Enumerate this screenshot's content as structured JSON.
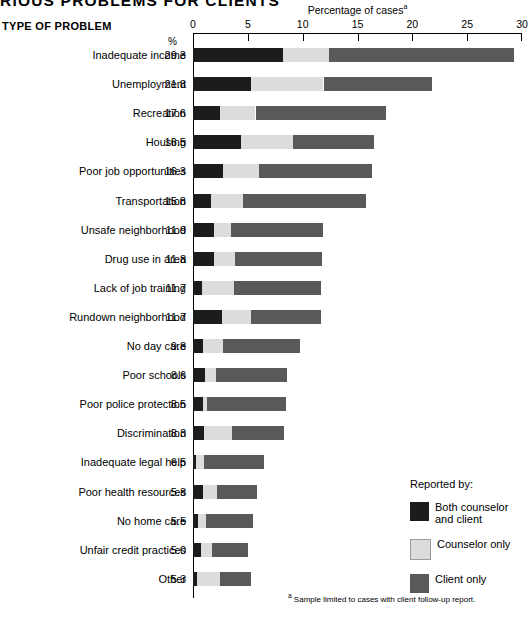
{
  "title": "RIOUS PROBLEMS FOR CLIENTS",
  "column_heading": "TYPE OF PROBLEM",
  "percent_symbol": "%",
  "axis_title": "Percentage of cases",
  "axis_title_footnote_marker": "a",
  "footnote": {
    "marker": "a",
    "text": "Sample limited to cases with client follow-up report."
  },
  "legend": {
    "title": "Reported by:",
    "items": [
      {
        "name": "both-counselor-and-client",
        "line1": "Both counselor",
        "line2": "and client",
        "color": "#1c1c1c"
      },
      {
        "name": "counselor-only",
        "line1": "Counselor only",
        "line2": "",
        "color": "#dcdcdc"
      },
      {
        "name": "client-only",
        "line1": "Client only",
        "line2": "",
        "color": "#595959"
      }
    ]
  },
  "chart_data": {
    "type": "bar",
    "orientation": "horizontal",
    "stacked": true,
    "title": "RIOUS PROBLEMS FOR CLIENTS",
    "xlabel": "Percentage of cases",
    "ylabel": "TYPE OF PROBLEM",
    "xlim": [
      0,
      30
    ],
    "xticks": [
      0,
      5,
      10,
      15,
      20,
      25,
      30
    ],
    "grid": false,
    "legend_position": "inside-right-lower",
    "series": [
      {
        "name": "Both counselor and client",
        "color": "#1c1c1c"
      },
      {
        "name": "Counselor only",
        "color": "#dcdcdc"
      },
      {
        "name": "Client only",
        "color": "#595959"
      }
    ],
    "categories": [
      "Inadequate income",
      "Unemployment",
      "Recreation",
      "Housing",
      "Poor job opportunities",
      "Transportation",
      "Unsafe neighborhood",
      "Drug use in area",
      "Lack of job training",
      "Rundown neighborhood",
      "No day care",
      "Poor schools",
      "Poor police protection",
      "Discrimination",
      "Inadequate legal help",
      "Poor health resources",
      "No home care",
      "Unfair credit practices",
      "Other"
    ],
    "totals": [
      29.3,
      21.8,
      17.6,
      16.5,
      16.3,
      15.8,
      11.9,
      11.8,
      11.7,
      11.7,
      9.8,
      8.6,
      8.5,
      8.3,
      6.5,
      5.8,
      5.5,
      5.0,
      5.3
    ],
    "rows": [
      {
        "category": "Inadequate income",
        "total": 29.3,
        "both": 8.2,
        "counselor": 4.2,
        "client": 16.9
      },
      {
        "category": "Unemployment",
        "total": 21.8,
        "both": 5.3,
        "counselor": 6.6,
        "client": 9.9
      },
      {
        "category": "Recreation",
        "total": 17.6,
        "both": 2.5,
        "counselor": 3.2,
        "client": 11.9
      },
      {
        "category": "Housing",
        "total": 16.5,
        "both": 4.4,
        "counselor": 4.7,
        "client": 7.4
      },
      {
        "category": "Poor job opportunities",
        "total": 16.3,
        "both": 2.7,
        "counselor": 3.3,
        "client": 10.3
      },
      {
        "category": "Transportation",
        "total": 15.8,
        "both": 1.6,
        "counselor": 3.0,
        "client": 11.2
      },
      {
        "category": "Unsafe neighborhood",
        "total": 11.9,
        "both": 1.9,
        "counselor": 1.6,
        "client": 8.4
      },
      {
        "category": "Drug use in area",
        "total": 11.8,
        "both": 1.9,
        "counselor": 1.9,
        "client": 8.0
      },
      {
        "category": "Lack of job training",
        "total": 11.7,
        "both": 0.8,
        "counselor": 2.9,
        "client": 8.0
      },
      {
        "category": "Rundown neighborhood",
        "total": 11.7,
        "both": 2.6,
        "counselor": 2.7,
        "client": 6.4
      },
      {
        "category": "No day care",
        "total": 9.8,
        "both": 0.9,
        "counselor": 1.8,
        "client": 7.1
      },
      {
        "category": "Poor schools",
        "total": 8.6,
        "both": 1.1,
        "counselor": 1.0,
        "client": 6.5
      },
      {
        "category": "Poor police protection",
        "total": 8.5,
        "both": 0.9,
        "counselor": 0.4,
        "client": 7.2
      },
      {
        "category": "Discrimination",
        "total": 8.3,
        "both": 1.0,
        "counselor": 2.6,
        "client": 4.7
      },
      {
        "category": "Inadequate legal help",
        "total": 6.5,
        "both": 0.3,
        "counselor": 0.7,
        "client": 5.5
      },
      {
        "category": "Poor health resources",
        "total": 5.8,
        "both": 0.9,
        "counselor": 1.3,
        "client": 3.6
      },
      {
        "category": "No home care",
        "total": 5.5,
        "both": 0.5,
        "counselor": 0.7,
        "client": 4.3
      },
      {
        "category": "Unfair credit practices",
        "total": 5.0,
        "both": 0.7,
        "counselor": 1.0,
        "client": 3.3
      },
      {
        "category": "Other",
        "total": 5.3,
        "both": 0.4,
        "counselor": 2.1,
        "client": 2.8
      }
    ]
  }
}
